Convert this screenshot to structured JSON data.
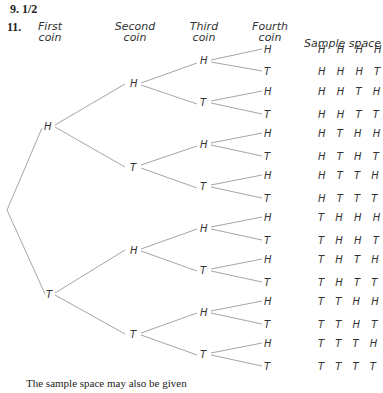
{
  "answers": [
    {
      "number": "9.",
      "text": "1/2"
    },
    {
      "number": "11.",
      "text": ""
    }
  ],
  "headers": {
    "first": [
      "First",
      "coin"
    ],
    "second": [
      "Second",
      "coin"
    ],
    "third": [
      "Third",
      "coin"
    ],
    "fourth": [
      "Fourth",
      "coin"
    ],
    "sample_space": "Sample space"
  },
  "tree": {
    "level1": [
      "H",
      "T"
    ],
    "level2": [
      "H",
      "T",
      "H",
      "T"
    ],
    "level3": [
      "H",
      "T",
      "H",
      "T",
      "H",
      "T",
      "H",
      "T"
    ],
    "level4": [
      "H",
      "T",
      "H",
      "T",
      "H",
      "T",
      "H",
      "T",
      "H",
      "T",
      "H",
      "T",
      "H",
      "T",
      "H",
      "T"
    ]
  },
  "sample_space": [
    "H H H H",
    "H H H T",
    "H H T H",
    "H H T T",
    "H T H H",
    "H T H T",
    "H T T H",
    "H T T T",
    "T H H H",
    "T H H T",
    "T H T H",
    "T H T T",
    "T T H H",
    "T T H T",
    "T T T H",
    "T T T T"
  ],
  "footer": "The sample space may also be given"
}
